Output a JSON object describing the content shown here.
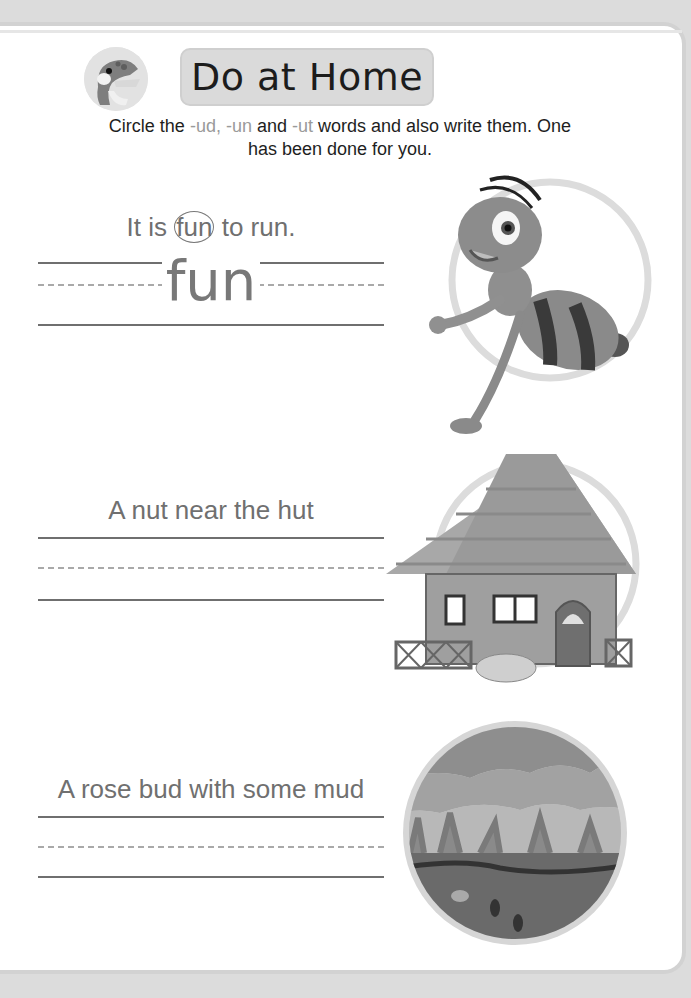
{
  "header": {
    "title": "Do at Home",
    "mascot_icon": "crocodile-mascot-icon"
  },
  "instructions": {
    "part1": "Circle the ",
    "suffix1": "-ud, -un",
    "part2": " and ",
    "suffix2": "-ut",
    "part3": " words and also write them. One has been done for you."
  },
  "exercises": [
    {
      "sentence_before": "It is ",
      "circled_word": "fun",
      "sentence_after": " to run.",
      "answer": "fun",
      "picture": "ant-illustration"
    },
    {
      "sentence": "A nut near the hut",
      "answer": "",
      "picture": "hut-with-nut-illustration"
    },
    {
      "sentence": "A rose bud with some mud",
      "answer": "",
      "picture": "muddy-field-illustration"
    }
  ],
  "colors": {
    "text": "#707070",
    "suffix": "#9a9a9a",
    "banner": "#dadada"
  }
}
